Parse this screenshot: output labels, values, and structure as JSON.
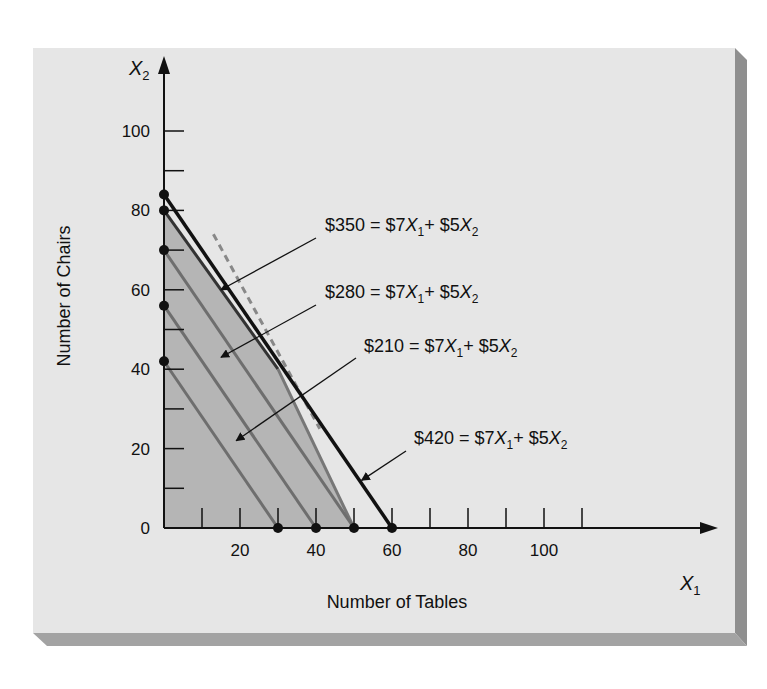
{
  "chart_data": {
    "type": "line",
    "title": "",
    "xlabel": "Number of Tables",
    "ylabel": "Number of Chairs",
    "x_axis_symbol": "X",
    "x_axis_sub": "1",
    "y_axis_symbol": "X",
    "y_axis_sub": "2",
    "xlim": [
      0,
      135
    ],
    "ylim": [
      0,
      110
    ],
    "x_ticks": [
      0,
      10,
      20,
      30,
      40,
      50,
      60,
      70,
      80,
      90,
      100,
      110
    ],
    "x_tick_labels": [
      "20",
      "40",
      "60",
      "80",
      "100"
    ],
    "x_tick_label_values": [
      20,
      40,
      60,
      80,
      100
    ],
    "y_ticks": [
      0,
      10,
      20,
      30,
      40,
      50,
      60,
      70,
      80,
      90,
      100
    ],
    "y_tick_labels": [
      "0",
      "20",
      "40",
      "60",
      "80",
      "100"
    ],
    "y_tick_label_values": [
      0,
      20,
      40,
      60,
      80,
      100
    ],
    "grid": false,
    "feasible_region": {
      "vertices": [
        [
          0,
          0
        ],
        [
          0,
          80
        ],
        [
          30,
          40
        ],
        [
          50,
          0
        ]
      ],
      "fill": "#b5b5b5"
    },
    "constraint_lines": [
      {
        "from": [
          0,
          80
        ],
        "to": [
          30,
          40
        ],
        "style": "solid",
        "color": "#333333"
      },
      {
        "from": [
          30,
          40
        ],
        "to": [
          50,
          0
        ],
        "style": "solid",
        "color": "#777777"
      },
      {
        "from": [
          13,
          74
        ],
        "to": [
          41,
          25
        ],
        "style": "dashed",
        "color": "#888888"
      }
    ],
    "series": [
      {
        "name": "$210 = $7X1 + $5X2",
        "profit": 210,
        "x_intercept": 30,
        "y_intercept": 42,
        "points": [
          [
            0,
            42
          ],
          [
            30,
            0
          ]
        ],
        "color": "#6e6e6e"
      },
      {
        "name": "$280 = $7X1 + $5X2",
        "profit": 280,
        "x_intercept": 40,
        "y_intercept": 56,
        "points": [
          [
            0,
            56
          ],
          [
            40,
            0
          ]
        ],
        "color": "#6e6e6e"
      },
      {
        "name": "$350 = $7X1 + $5X2",
        "profit": 350,
        "x_intercept": 50,
        "y_intercept": 70,
        "points": [
          [
            0,
            70
          ],
          [
            50,
            0
          ]
        ],
        "color": "#6e6e6e"
      },
      {
        "name": "$420 = $7X1 + $5X2",
        "profit": 420,
        "x_intercept": 60,
        "y_intercept": 84,
        "points": [
          [
            0,
            84
          ],
          [
            60,
            0
          ]
        ],
        "color": "#111111"
      }
    ],
    "intercept_points": [
      [
        0,
        84
      ],
      [
        0,
        80
      ],
      [
        0,
        70
      ],
      [
        0,
        56
      ],
      [
        0,
        42
      ],
      [
        30,
        0
      ],
      [
        40,
        0
      ],
      [
        50,
        0
      ],
      [
        60,
        0
      ]
    ],
    "annotations": [
      {
        "lhs": "$350 = $7",
        "mid": "+ $5",
        "profit": 350,
        "text": "$350 = $7X1+ $5X2",
        "arrow_to": [
          15,
          60
        ]
      },
      {
        "lhs": "$280 = $7",
        "mid": "+ $5",
        "profit": 280,
        "text": "$280 = $7X1+ $5X2",
        "arrow_to": [
          15,
          43
        ]
      },
      {
        "lhs": "$210 = $7",
        "mid": "+ $5",
        "profit": 210,
        "text": "$210 = $7X1+ $5X2",
        "arrow_to": [
          19,
          22
        ]
      },
      {
        "lhs": "$420 = $7",
        "mid": "+ $5",
        "profit": 420,
        "text": "$420 = $7X1+ $5X2",
        "arrow_to": [
          52,
          12
        ]
      }
    ],
    "legend": "none",
    "panel_background": "#e6e6e6",
    "panel_shadow": "#8f8f8f"
  }
}
